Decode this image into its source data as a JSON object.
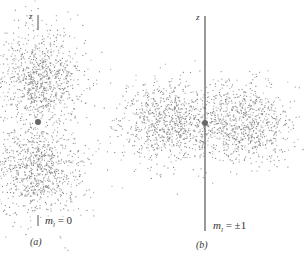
{
  "figure": {
    "panels": [
      {
        "id": "a",
        "caption": "(a)",
        "axis_label": "z",
        "quantum_label": "m",
        "quantum_sub": "l",
        "quantum_value": "= 0",
        "orientation": "vertical lobes along z-axis"
      },
      {
        "id": "b",
        "caption": "(b)",
        "axis_label": "z",
        "quantum_label": "m",
        "quantum_sub": "l",
        "quantum_value": "= ±1",
        "orientation": "horizontal lobes perpendicular to z-axis"
      }
    ],
    "colors": {
      "dots": "#7a7a7a",
      "axis": "#555555",
      "nucleus": "#666666"
    }
  }
}
